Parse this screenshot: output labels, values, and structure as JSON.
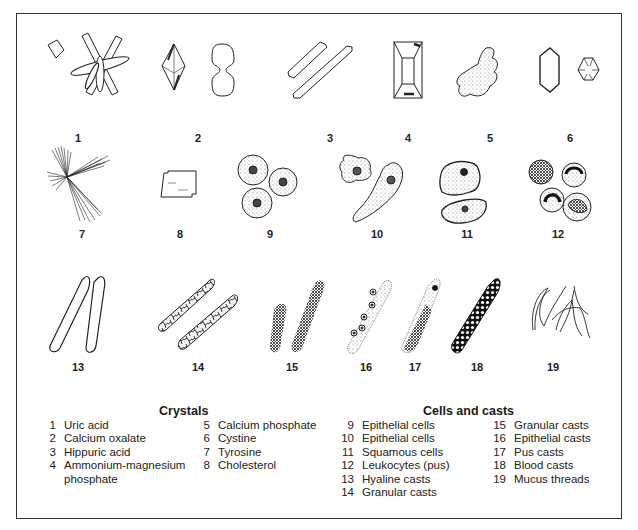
{
  "figures": [
    {
      "num": "1",
      "x": 78,
      "y": 132
    },
    {
      "num": "2",
      "x": 198,
      "y": 132
    },
    {
      "num": "3",
      "x": 330,
      "y": 132
    },
    {
      "num": "4",
      "x": 408,
      "y": 132
    },
    {
      "num": "5",
      "x": 490,
      "y": 132
    },
    {
      "num": "6",
      "x": 570,
      "y": 132
    },
    {
      "num": "7",
      "x": 82,
      "y": 228
    },
    {
      "num": "8",
      "x": 180,
      "y": 228
    },
    {
      "num": "9",
      "x": 270,
      "y": 228
    },
    {
      "num": "10",
      "x": 377,
      "y": 228
    },
    {
      "num": "11",
      "x": 467,
      "y": 228
    },
    {
      "num": "12",
      "x": 558,
      "y": 228
    },
    {
      "num": "13",
      "x": 78,
      "y": 361
    },
    {
      "num": "14",
      "x": 198,
      "y": 361
    },
    {
      "num": "15",
      "x": 292,
      "y": 361
    },
    {
      "num": "16",
      "x": 366,
      "y": 361
    },
    {
      "num": "17",
      "x": 415,
      "y": 361
    },
    {
      "num": "18",
      "x": 477,
      "y": 361
    },
    {
      "num": "19",
      "x": 553,
      "y": 361
    }
  ],
  "legend": {
    "crystals": {
      "title": "Crystals",
      "col1": [
        {
          "n": "1",
          "label": "Uric acid"
        },
        {
          "n": "2",
          "label": "Calcium oxalate"
        },
        {
          "n": "3",
          "label": "Hippuric acid"
        },
        {
          "n": "4",
          "label": "Ammonium-magnesium",
          "label2": "phosphate"
        }
      ],
      "col2": [
        {
          "n": "5",
          "label": "Calcium phosphate"
        },
        {
          "n": "6",
          "label": "Cystine"
        },
        {
          "n": "7",
          "label": "Tyrosine"
        },
        {
          "n": "8",
          "label": "Cholesterol"
        }
      ]
    },
    "cells": {
      "title": "Cells and casts",
      "col1": [
        {
          "n": "9",
          "label": "Epithelial cells"
        },
        {
          "n": "10",
          "label": "Epithelial cells"
        },
        {
          "n": "11",
          "label": "Squamous cells"
        },
        {
          "n": "12",
          "label": "Leukocytes (pus)"
        },
        {
          "n": "13",
          "label": "Hyaline casts"
        },
        {
          "n": "14",
          "label": "Granular casts"
        }
      ],
      "col2": [
        {
          "n": "15",
          "label": "Granular casts"
        },
        {
          "n": "16",
          "label": "Epithelial casts"
        },
        {
          "n": "17",
          "label": "Pus casts"
        },
        {
          "n": "18",
          "label": "Blood casts"
        },
        {
          "n": "19",
          "label": "Mucus threads"
        }
      ]
    }
  }
}
